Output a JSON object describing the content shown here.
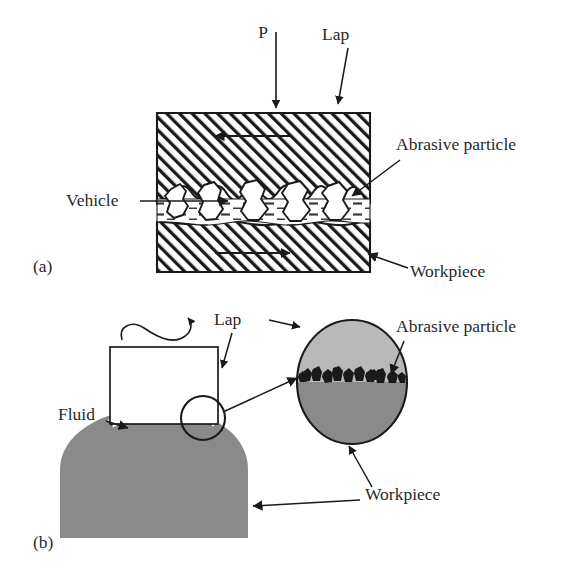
{
  "figure": {
    "type": "technical-diagram",
    "panels": [
      {
        "id": "a",
        "tag": "(a)",
        "description": "Cross-section of flat lapping: lap above, workpiece below, abrasive particles in vehicle between",
        "labels": {
          "pressure": "P",
          "lap": "Lap",
          "abrasive_particle": "Abrasive particle",
          "vehicle": "Vehicle",
          "workpiece": "Workpiece"
        }
      },
      {
        "id": "b",
        "tag": "(b)",
        "description": "Lapping of a curved (domed) workpiece with rotating lap and fluid film, with magnified inset of the contact zone",
        "labels": {
          "lap": "Lap",
          "fluid": "Fluid",
          "abrasive_particle": "Abrasive particle",
          "workpiece": "Workpiece"
        }
      }
    ]
  },
  "colors": {
    "ink": "#2a2a2a",
    "line": "#1a1a1a",
    "white": "#ffffff",
    "lap_gray_light": "#b9b9b9",
    "workpiece_gray": "#8a8a8a",
    "particle_black": "#1a1a1a",
    "hatch": "#1a1a1a"
  },
  "panel_a": {
    "tag": "(a)",
    "pressure_label": "P",
    "lap_label": "Lap",
    "abrasive_label": "Abrasive particle",
    "vehicle_label": "Vehicle",
    "workpiece_label": "Workpiece",
    "lap_motion": "left",
    "workpiece_motion": "right",
    "particle_count": 5
  },
  "panel_b": {
    "tag": "(b)",
    "lap_label": "Lap",
    "fluid_label": "Fluid",
    "abrasive_label": "Abrasive particle",
    "workpiece_label": "Workpiece",
    "rotation": "clockwise",
    "inset_particle_count": 12
  }
}
